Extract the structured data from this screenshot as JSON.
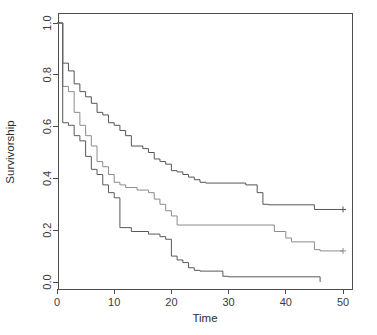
{
  "chart_data": {
    "type": "line",
    "subtype": "kaplan-meier-survival-step",
    "title": "",
    "xlabel": "Time",
    "ylabel": "Survivorship",
    "xlim": [
      0,
      52
    ],
    "ylim": [
      0.0,
      1.0
    ],
    "xticks": [
      0,
      10,
      20,
      30,
      40,
      50
    ],
    "xticklabels": [
      "0",
      "10",
      "20",
      "30",
      "40",
      "50"
    ],
    "yticks": [
      0.0,
      0.2,
      0.4,
      0.6,
      0.8,
      1.0
    ],
    "yticklabels": [
      "0.0",
      "0.2",
      "0.4",
      "0.6",
      "0.8",
      "1.0"
    ],
    "grid": false,
    "legend": "none",
    "box_border": true,
    "series": [
      {
        "name": "upper-curve",
        "color": "#555555",
        "censored": [
          [
            50,
            0.28
          ]
        ],
        "points": [
          [
            0,
            1.0
          ],
          [
            1,
            1.0
          ],
          [
            1,
            0.845
          ],
          [
            2,
            0.845
          ],
          [
            2,
            0.815
          ],
          [
            3,
            0.815
          ],
          [
            3,
            0.765
          ],
          [
            4,
            0.765
          ],
          [
            4,
            0.735
          ],
          [
            5,
            0.735
          ],
          [
            5,
            0.715
          ],
          [
            6,
            0.715
          ],
          [
            6,
            0.69
          ],
          [
            7,
            0.69
          ],
          [
            7,
            0.655
          ],
          [
            8,
            0.655
          ],
          [
            8,
            0.645
          ],
          [
            9,
            0.645
          ],
          [
            9,
            0.615
          ],
          [
            10,
            0.615
          ],
          [
            10,
            0.605
          ],
          [
            11,
            0.605
          ],
          [
            11,
            0.585
          ],
          [
            12,
            0.585
          ],
          [
            12,
            0.565
          ],
          [
            13,
            0.565
          ],
          [
            13,
            0.525
          ],
          [
            15,
            0.525
          ],
          [
            15,
            0.515
          ],
          [
            16,
            0.515
          ],
          [
            16,
            0.5
          ],
          [
            17,
            0.5
          ],
          [
            17,
            0.475
          ],
          [
            18,
            0.475
          ],
          [
            18,
            0.465
          ],
          [
            19,
            0.465
          ],
          [
            19,
            0.455
          ],
          [
            20,
            0.455
          ],
          [
            20,
            0.43
          ],
          [
            21,
            0.43
          ],
          [
            21,
            0.425
          ],
          [
            22,
            0.425
          ],
          [
            22,
            0.415
          ],
          [
            23,
            0.415
          ],
          [
            23,
            0.405
          ],
          [
            24,
            0.405
          ],
          [
            24,
            0.395
          ],
          [
            25,
            0.395
          ],
          [
            25,
            0.385
          ],
          [
            26,
            0.385
          ],
          [
            26,
            0.382
          ],
          [
            33,
            0.382
          ],
          [
            33,
            0.375
          ],
          [
            35,
            0.375
          ],
          [
            35,
            0.345
          ],
          [
            36,
            0.345
          ],
          [
            36,
            0.3
          ],
          [
            37,
            0.3
          ],
          [
            37,
            0.298
          ],
          [
            45,
            0.298
          ],
          [
            45,
            0.28
          ],
          [
            50,
            0.28
          ]
        ]
      },
      {
        "name": "middle-curve",
        "color": "#8c8c8c",
        "censored": [
          [
            50,
            0.12
          ]
        ],
        "points": [
          [
            0,
            1.0
          ],
          [
            1,
            1.0
          ],
          [
            1,
            0.755
          ],
          [
            2,
            0.755
          ],
          [
            2,
            0.735
          ],
          [
            3,
            0.735
          ],
          [
            3,
            0.655
          ],
          [
            4,
            0.655
          ],
          [
            4,
            0.605
          ],
          [
            5,
            0.605
          ],
          [
            5,
            0.565
          ],
          [
            6,
            0.565
          ],
          [
            6,
            0.525
          ],
          [
            7,
            0.525
          ],
          [
            7,
            0.465
          ],
          [
            8,
            0.465
          ],
          [
            8,
            0.445
          ],
          [
            9,
            0.445
          ],
          [
            9,
            0.415
          ],
          [
            10,
            0.415
          ],
          [
            10,
            0.385
          ],
          [
            11,
            0.385
          ],
          [
            11,
            0.375
          ],
          [
            12,
            0.375
          ],
          [
            12,
            0.365
          ],
          [
            14,
            0.365
          ],
          [
            14,
            0.355
          ],
          [
            16,
            0.355
          ],
          [
            16,
            0.345
          ],
          [
            17,
            0.345
          ],
          [
            17,
            0.32
          ],
          [
            18,
            0.32
          ],
          [
            18,
            0.3
          ],
          [
            19,
            0.3
          ],
          [
            19,
            0.275
          ],
          [
            20,
            0.275
          ],
          [
            20,
            0.255
          ],
          [
            21,
            0.255
          ],
          [
            21,
            0.22
          ],
          [
            38,
            0.22
          ],
          [
            38,
            0.195
          ],
          [
            40,
            0.195
          ],
          [
            40,
            0.17
          ],
          [
            41,
            0.17
          ],
          [
            41,
            0.155
          ],
          [
            45,
            0.155
          ],
          [
            45,
            0.125
          ],
          [
            46,
            0.125
          ],
          [
            46,
            0.12
          ],
          [
            50,
            0.12
          ]
        ]
      },
      {
        "name": "lower-curve",
        "color": "#595959",
        "censored": [],
        "points": [
          [
            0,
            1.0
          ],
          [
            1,
            1.0
          ],
          [
            1,
            0.615
          ],
          [
            2,
            0.615
          ],
          [
            2,
            0.605
          ],
          [
            3,
            0.605
          ],
          [
            3,
            0.565
          ],
          [
            4,
            0.565
          ],
          [
            4,
            0.545
          ],
          [
            5,
            0.545
          ],
          [
            5,
            0.485
          ],
          [
            6,
            0.485
          ],
          [
            6,
            0.435
          ],
          [
            7,
            0.435
          ],
          [
            7,
            0.415
          ],
          [
            8,
            0.415
          ],
          [
            8,
            0.375
          ],
          [
            9,
            0.375
          ],
          [
            9,
            0.345
          ],
          [
            10,
            0.345
          ],
          [
            10,
            0.325
          ],
          [
            11,
            0.325
          ],
          [
            11,
            0.21
          ],
          [
            13,
            0.21
          ],
          [
            13,
            0.195
          ],
          [
            16,
            0.195
          ],
          [
            16,
            0.185
          ],
          [
            18,
            0.185
          ],
          [
            18,
            0.175
          ],
          [
            19,
            0.175
          ],
          [
            19,
            0.165
          ],
          [
            20,
            0.165
          ],
          [
            20,
            0.1
          ],
          [
            21,
            0.1
          ],
          [
            21,
            0.085
          ],
          [
            22,
            0.085
          ],
          [
            22,
            0.075
          ],
          [
            23,
            0.075
          ],
          [
            23,
            0.055
          ],
          [
            24,
            0.055
          ],
          [
            24,
            0.045
          ],
          [
            25,
            0.045
          ],
          [
            25,
            0.042
          ],
          [
            29,
            0.042
          ],
          [
            29,
            0.022
          ],
          [
            30,
            0.022
          ],
          [
            30,
            0.02
          ],
          [
            46,
            0.02
          ],
          [
            46,
            0.0
          ],
          [
            46,
            0.0
          ]
        ]
      }
    ]
  },
  "geometry": {
    "plot_left": 58,
    "plot_right": 352,
    "plot_top": 13,
    "plot_bottom": 289,
    "x0_px": 57,
    "x50_px": 343,
    "y0_px": 282,
    "y1_px": 23
  }
}
